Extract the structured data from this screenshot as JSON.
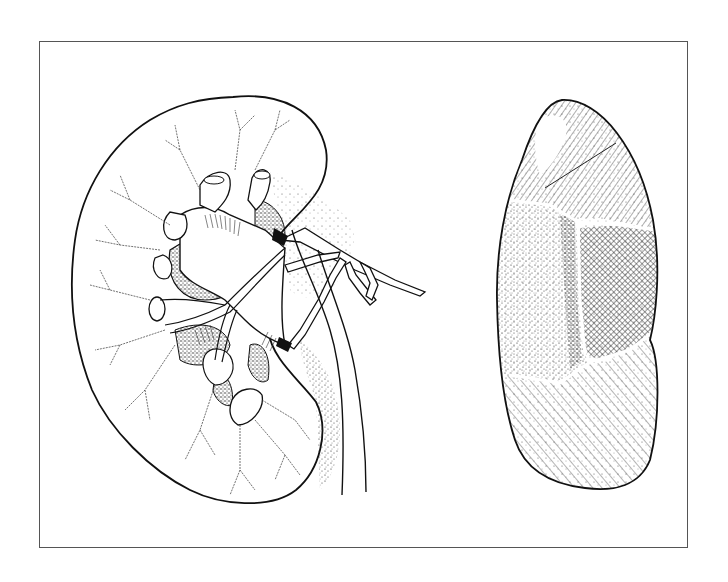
{
  "figure": {
    "panels": [
      {
        "id": "left",
        "subject": "kidney-longitudinal-section",
        "description": "Sectioned kidney showing renal pelvis, calyces, renal vessels branching, and ureter"
      },
      {
        "id": "right",
        "subject": "kidney-posterior-surface-zones",
        "description": "Kidney outline divided into hatched zones: upper pole (diagonal hatch), middle stippled zone, cross-hatched zone, lower pole (diagonal hatch)"
      }
    ],
    "colors": {
      "ink": "#111111",
      "paper": "#ffffff",
      "frame": "#555555"
    }
  }
}
